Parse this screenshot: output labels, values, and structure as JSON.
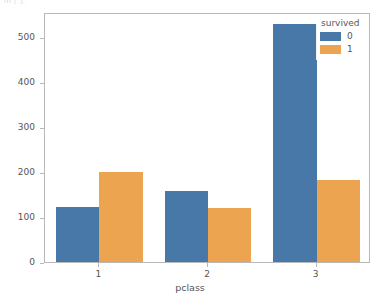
{
  "figure": {
    "background_color": "#ffffff",
    "spine_color": "#b8b8b8",
    "text_color": "#555555",
    "top_artifact_text": "In [ ]:"
  },
  "legend": {
    "title": "survived",
    "position": "upper right",
    "entries": [
      {
        "label": "0",
        "color": "#4878a8"
      },
      {
        "label": "1",
        "color": "#eda450"
      }
    ]
  },
  "axis": {
    "y_ticks": [
      "0",
      "100",
      "200",
      "300",
      "400",
      "500"
    ],
    "y_tick_values": [
      0,
      100,
      200,
      300,
      400,
      500
    ],
    "x_ticks": [
      "1",
      "2",
      "3"
    ],
    "xlabel": "pclass",
    "ylabel": "count"
  },
  "chart_data": {
    "type": "bar",
    "title": "",
    "xlabel": "pclass",
    "ylabel": "count",
    "categories": [
      "1",
      "2",
      "3"
    ],
    "series": [
      {
        "name": "0",
        "color": "#4878a8",
        "values": [
          123,
          158,
          528
        ]
      },
      {
        "name": "1",
        "color": "#eda450",
        "values": [
          200,
          119,
          181
        ]
      }
    ],
    "legend_title": "survived",
    "legend_position": "upper right",
    "ylim": [
      0,
      555
    ],
    "yticks": [
      0,
      100,
      200,
      300,
      400,
      500
    ],
    "grid": false,
    "orientation": "vertical",
    "bar_group_gap": 0.2
  }
}
